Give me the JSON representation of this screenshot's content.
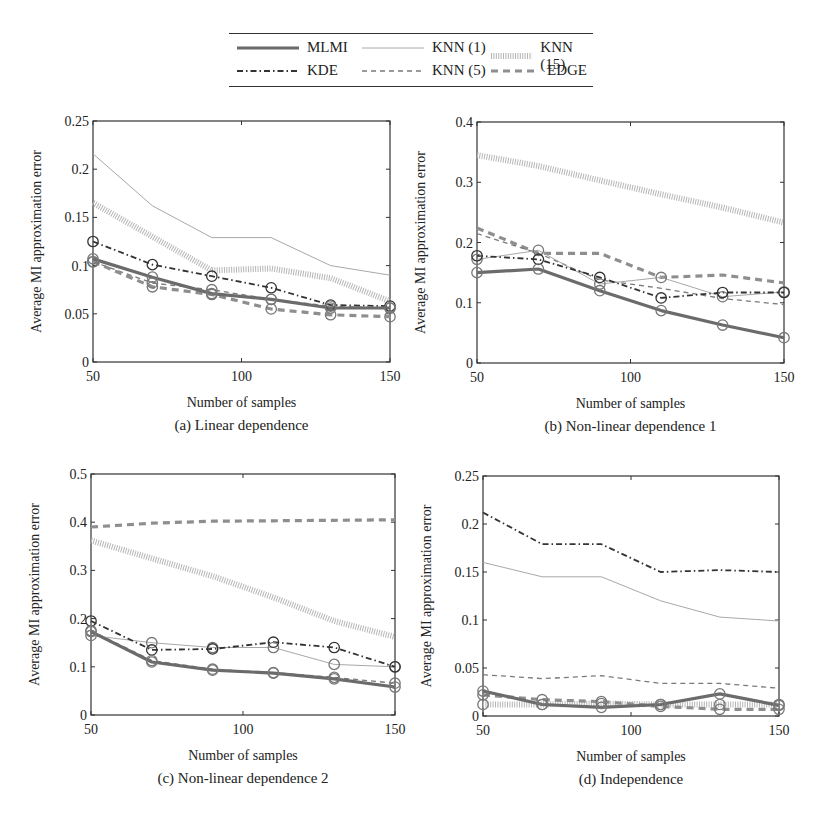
{
  "legend": {
    "items": [
      {
        "key": "mlmi",
        "label": "MLMI"
      },
      {
        "key": "knn1",
        "label": "KNN (1)"
      },
      {
        "key": "knn15",
        "label": "KNN (15)"
      },
      {
        "key": "kde",
        "label": "KDE"
      },
      {
        "key": "knn5",
        "label": "KNN (5)"
      },
      {
        "key": "edge",
        "label": "EDGE"
      }
    ]
  },
  "styles": {
    "mlmi": {
      "color": "#6b6b6b",
      "width": 3.2,
      "dash": ""
    },
    "knn1": {
      "color": "#a8a8a8",
      "width": 1.0,
      "dash": ""
    },
    "knn15": {
      "color": "#b5b5b5",
      "width": 6.0,
      "dash": "1,1.4"
    },
    "kde": {
      "color": "#333333",
      "width": 1.8,
      "dash": "6,3,1.5,3"
    },
    "knn5": {
      "color": "#7a7a7a",
      "width": 1.3,
      "dash": "5,4"
    },
    "edge": {
      "color": "#8e8e8e",
      "width": 3.2,
      "dash": "7,5"
    }
  },
  "chart_data": [
    {
      "type": "line",
      "id": "a",
      "caption": "(a) Linear dependence",
      "xlabel": "Number of samples",
      "ylabel": "Average MI approximation error",
      "x": [
        50,
        70,
        90,
        110,
        130,
        150
      ],
      "xticks": [
        50,
        100,
        150
      ],
      "yticks": [
        0,
        0.05,
        0.1,
        0.15,
        0.2,
        0.25
      ],
      "ytick_labels": [
        "0",
        "0.05",
        "0.1",
        "0.15",
        "0.2",
        "0.25"
      ],
      "ylim": [
        0,
        0.25
      ],
      "frame": {
        "x0": 93,
        "x1": 390,
        "y0": 121,
        "y1": 362
      },
      "series": [
        {
          "name": "KNN (1)",
          "key": "knn1",
          "values": [
            0.216,
            0.162,
            0.129,
            0.129,
            0.1,
            0.09
          ],
          "markers": false
        },
        {
          "name": "KNN (15)",
          "key": "knn15",
          "values": [
            0.165,
            0.13,
            0.095,
            0.097,
            0.087,
            0.063
          ],
          "markers": false
        },
        {
          "name": "KDE",
          "key": "kde",
          "values": [
            0.125,
            0.101,
            0.089,
            0.077,
            0.059,
            0.058
          ],
          "markers": true
        },
        {
          "name": "KNN (5)",
          "key": "knn5",
          "values": [
            0.104,
            0.082,
            0.075,
            0.065,
            0.058,
            0.056
          ],
          "markers": true
        },
        {
          "name": "EDGE",
          "key": "edge",
          "values": [
            0.104,
            0.078,
            0.07,
            0.055,
            0.049,
            0.047
          ],
          "markers": true
        },
        {
          "name": "MLMI",
          "key": "mlmi",
          "values": [
            0.107,
            0.088,
            0.071,
            0.065,
            0.056,
            0.056
          ],
          "markers": true
        }
      ]
    },
    {
      "type": "line",
      "id": "b",
      "caption": "(b) Non-linear dependence 1",
      "xlabel": "Number of samples",
      "ylabel": "Average MI approximation error",
      "x": [
        50,
        70,
        90,
        110,
        130,
        150
      ],
      "xticks": [
        50,
        100,
        150
      ],
      "yticks": [
        0,
        0.1,
        0.2,
        0.3,
        0.4
      ],
      "ytick_labels": [
        "0",
        "0.1",
        "0.2",
        "0.3",
        "0.4"
      ],
      "ylim": [
        0,
        0.4
      ],
      "frame": {
        "x0": 477,
        "x1": 784,
        "y0": 122,
        "y1": 363
      },
      "series": [
        {
          "name": "KNN (15)",
          "key": "knn15",
          "values": [
            0.345,
            0.327,
            0.303,
            0.28,
            0.258,
            0.233
          ],
          "markers": false
        },
        {
          "name": "EDGE",
          "key": "edge",
          "values": [
            0.224,
            0.182,
            0.182,
            0.142,
            0.146,
            0.133
          ],
          "markers": false
        },
        {
          "name": "KNN (5)",
          "key": "knn5",
          "values": [
            0.215,
            0.182,
            0.138,
            0.124,
            0.107,
            0.097
          ],
          "markers": false
        },
        {
          "name": "KNN (1)",
          "key": "knn1",
          "values": [
            0.172,
            0.187,
            0.131,
            0.142,
            0.11,
            0.118
          ],
          "markers": true
        },
        {
          "name": "KDE",
          "key": "kde",
          "values": [
            0.178,
            0.172,
            0.142,
            0.108,
            0.117,
            0.117
          ],
          "markers": true
        },
        {
          "name": "MLMI",
          "key": "mlmi",
          "values": [
            0.15,
            0.156,
            0.12,
            0.087,
            0.063,
            0.042
          ],
          "markers": true
        }
      ]
    },
    {
      "type": "line",
      "id": "c",
      "caption": "(c) Non-linear dependence 2",
      "xlabel": "Number of samples",
      "ylabel": "Average MI approximation error",
      "x": [
        50,
        70,
        90,
        110,
        130,
        150
      ],
      "xticks": [
        50,
        100,
        150
      ],
      "yticks": [
        0,
        0.1,
        0.2,
        0.3,
        0.4,
        0.5
      ],
      "ytick_labels": [
        "0",
        "0.1",
        "0.2",
        "0.3",
        "0.4",
        "0.5"
      ],
      "ylim": [
        0,
        0.5
      ],
      "frame": {
        "x0": 91,
        "x1": 395,
        "y0": 474,
        "y1": 715
      },
      "series": [
        {
          "name": "EDGE",
          "key": "edge",
          "values": [
            0.39,
            0.398,
            0.402,
            0.403,
            0.404,
            0.405
          ],
          "markers": false
        },
        {
          "name": "KNN (15)",
          "key": "knn15",
          "values": [
            0.362,
            0.325,
            0.288,
            0.244,
            0.195,
            0.162
          ],
          "markers": false
        },
        {
          "name": "KNN (1)",
          "key": "knn1",
          "values": [
            0.165,
            0.15,
            0.14,
            0.14,
            0.105,
            0.1
          ],
          "markers": true
        },
        {
          "name": "KDE",
          "key": "kde",
          "values": [
            0.195,
            0.135,
            0.137,
            0.151,
            0.14,
            0.1
          ],
          "markers": true
        },
        {
          "name": "KNN (5)",
          "key": "knn5",
          "values": [
            0.175,
            0.113,
            0.095,
            0.088,
            0.078,
            0.066
          ],
          "markers": true
        },
        {
          "name": "MLMI",
          "key": "mlmi",
          "values": [
            0.173,
            0.11,
            0.093,
            0.087,
            0.075,
            0.058
          ],
          "markers": true
        }
      ]
    },
    {
      "type": "line",
      "id": "d",
      "caption": "(d) Independence",
      "xlabel": "Number of samples",
      "ylabel": "Average MI approximation error",
      "x": [
        50,
        70,
        90,
        110,
        130,
        150
      ],
      "xticks": [
        50,
        100,
        150
      ],
      "yticks": [
        0,
        0.05,
        0.1,
        0.15,
        0.2,
        0.25
      ],
      "ytick_labels": [
        "0",
        "0.05",
        "0.1",
        "0.15",
        "0.2",
        "0.25"
      ],
      "ylim": [
        0,
        0.25
      ],
      "frame": {
        "x0": 483,
        "x1": 779,
        "y0": 476,
        "y1": 716
      },
      "series": [
        {
          "name": "KDE",
          "key": "kde",
          "values": [
            0.212,
            0.179,
            0.179,
            0.15,
            0.152,
            0.15
          ],
          "markers": false
        },
        {
          "name": "KNN (1)",
          "key": "knn1",
          "values": [
            0.16,
            0.145,
            0.145,
            0.12,
            0.103,
            0.099
          ],
          "markers": false
        },
        {
          "name": "KNN (5)",
          "key": "knn5",
          "values": [
            0.043,
            0.039,
            0.042,
            0.034,
            0.034,
            0.029
          ],
          "markers": false
        },
        {
          "name": "KNN (15)",
          "key": "knn15",
          "values": [
            0.012,
            0.012,
            0.013,
            0.012,
            0.012,
            0.012
          ],
          "markers": true
        },
        {
          "name": "EDGE",
          "key": "edge",
          "values": [
            0.022,
            0.017,
            0.015,
            0.01,
            0.007,
            0.007
          ],
          "markers": true
        },
        {
          "name": "MLMI",
          "key": "mlmi",
          "values": [
            0.026,
            0.012,
            0.009,
            0.012,
            0.023,
            0.011
          ],
          "markers": true
        }
      ]
    }
  ]
}
